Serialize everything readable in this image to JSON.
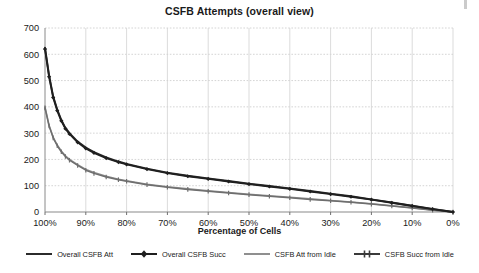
{
  "chart_data": {
    "type": "line",
    "title": "CSFB Attempts (overall view)",
    "xlabel": "Percentage of Cells",
    "ylabel": "",
    "xlim": [
      100,
      0
    ],
    "ylim": [
      0,
      700
    ],
    "grid": true,
    "legend_position": "bottom",
    "x_ticks": [
      "100%",
      "90%",
      "80%",
      "70%",
      "60%",
      "50%",
      "40%",
      "30%",
      "20%",
      "10%",
      "0%"
    ],
    "x_tick_values": [
      100,
      90,
      80,
      70,
      60,
      50,
      40,
      30,
      20,
      10,
      0
    ],
    "y_ticks": [
      "0",
      "100",
      "200",
      "300",
      "400",
      "500",
      "600",
      "700"
    ],
    "y_tick_values": [
      0,
      100,
      200,
      300,
      400,
      500,
      600,
      700
    ],
    "x": [
      100,
      99,
      98,
      97,
      96,
      95,
      94,
      92,
      90,
      88,
      85,
      82,
      80,
      75,
      70,
      65,
      60,
      55,
      50,
      45,
      40,
      35,
      30,
      25,
      20,
      15,
      10,
      5,
      0
    ],
    "series": [
      {
        "name": "Overall CSFB Att",
        "color": "#2b2b2b",
        "marker": "none",
        "values": [
          625,
          520,
          440,
          390,
          350,
          320,
          300,
          268,
          245,
          228,
          208,
          192,
          183,
          165,
          150,
          138,
          128,
          118,
          108,
          99,
          90,
          80,
          70,
          60,
          48,
          36,
          24,
          12,
          0
        ]
      },
      {
        "name": "Overall CSFB Succ",
        "color": "#1f1f1f",
        "marker": "diamond",
        "values": [
          620,
          515,
          436,
          386,
          347,
          317,
          297,
          265,
          242,
          225,
          205,
          190,
          181,
          163,
          148,
          136,
          126,
          116,
          106,
          97,
          88,
          78,
          68,
          58,
          47,
          35,
          23,
          11,
          0
        ]
      },
      {
        "name": "CSFB Att from Idle",
        "color": "#8f8f8f",
        "marker": "none",
        "values": [
          400,
          330,
          285,
          255,
          232,
          214,
          200,
          180,
          162,
          150,
          136,
          125,
          119,
          106,
          96,
          88,
          81,
          74,
          68,
          62,
          56,
          50,
          44,
          38,
          31,
          24,
          16,
          8,
          0
        ]
      },
      {
        "name": "CSFB Succ from Idle",
        "color": "#6e6e6e",
        "marker": "tick",
        "values": [
          396,
          327,
          282,
          252,
          229,
          211,
          197,
          177,
          159,
          147,
          133,
          123,
          117,
          104,
          94,
          86,
          79,
          72,
          66,
          60,
          54,
          48,
          43,
          37,
          30,
          23,
          15,
          7,
          0
        ]
      }
    ]
  },
  "legend": {
    "items": [
      {
        "label": "Overall CSFB Att"
      },
      {
        "label": "Overall CSFB Succ"
      },
      {
        "label": "CSFB Att from Idle"
      },
      {
        "label": "CSFB Succ from Idle"
      }
    ]
  }
}
